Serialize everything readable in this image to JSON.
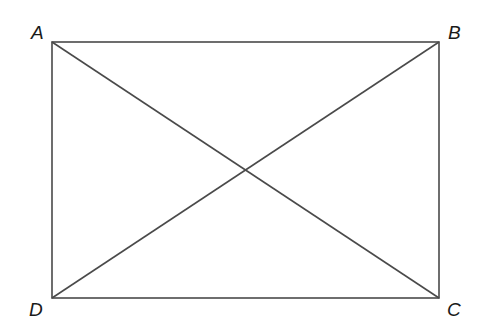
{
  "diagram": {
    "shape": "rectangle",
    "stroke_color": "#4a4a4a",
    "background": "#ffffff",
    "vertices": [
      {
        "label": "A",
        "x": 52,
        "y": 42
      },
      {
        "label": "B",
        "x": 439,
        "y": 42
      },
      {
        "label": "C",
        "x": 439,
        "y": 298
      },
      {
        "label": "D",
        "x": 52,
        "y": 298
      }
    ],
    "edges": [
      {
        "from": "A",
        "to": "B"
      },
      {
        "from": "B",
        "to": "C"
      },
      {
        "from": "C",
        "to": "D"
      },
      {
        "from": "D",
        "to": "A"
      }
    ],
    "diagonals": [
      {
        "from": "A",
        "to": "C"
      },
      {
        "from": "B",
        "to": "D"
      }
    ],
    "labels": {
      "A": "A",
      "B": "B",
      "C": "C",
      "D": "D"
    }
  }
}
